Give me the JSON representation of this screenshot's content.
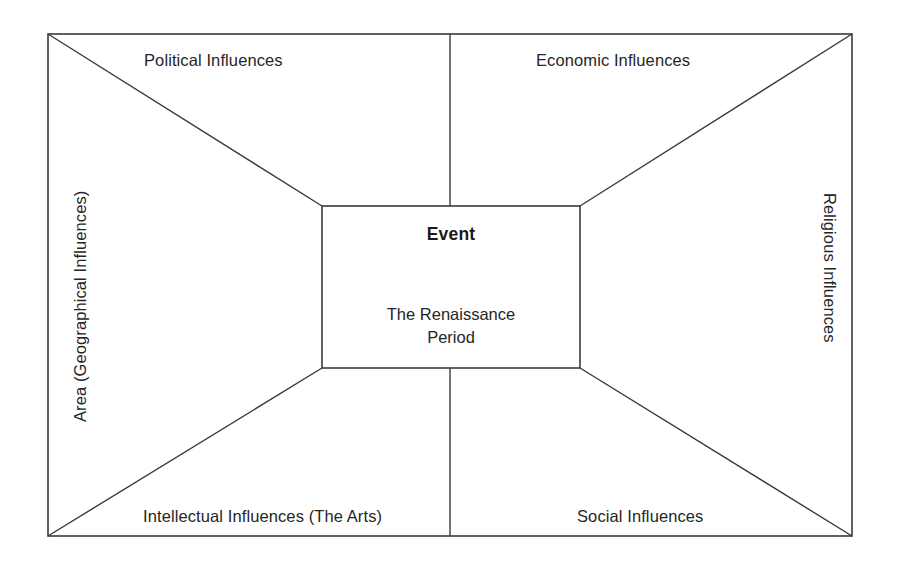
{
  "diagram": {
    "type": "perspective-influences-box",
    "background_color": "#ffffff",
    "line_color": "#3a3a3a",
    "text_color": "#262626",
    "outer_box": {
      "x1": 48,
      "y1": 34,
      "x2": 852,
      "y2": 536
    },
    "center_box": {
      "x1": 322,
      "y1": 206,
      "x2": 580,
      "y2": 368
    },
    "divider_x": 450
  },
  "center": {
    "title": "Event",
    "line1": "The Renaissance",
    "line2": "Period"
  },
  "quadrants": {
    "top_left": "Political Influences",
    "top_right": "Economic Influences",
    "bottom_left": "Intellectual Influences (The Arts)",
    "bottom_right": "Social Influences"
  },
  "sides": {
    "left": "Area (Geographical Influences)",
    "right": "Religious Influences"
  }
}
